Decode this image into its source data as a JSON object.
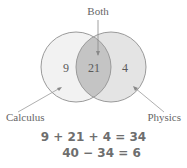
{
  "diagram": {
    "type": "venn",
    "labels": {
      "both": "Both",
      "left": "Calculus",
      "right": "Physics"
    },
    "regions": {
      "left_only": "9",
      "both": "21",
      "right_only": "4"
    },
    "colors": {
      "left_fill": "#f2f2f2",
      "right_fill": "#e4e4e4",
      "overlap_fill": "#c4c4c4",
      "stroke": "#9a9a9a",
      "text": "#666666"
    }
  },
  "equations": {
    "line1": "9 + 21 + 4 = 34",
    "line2": "40 − 34 = 6"
  }
}
